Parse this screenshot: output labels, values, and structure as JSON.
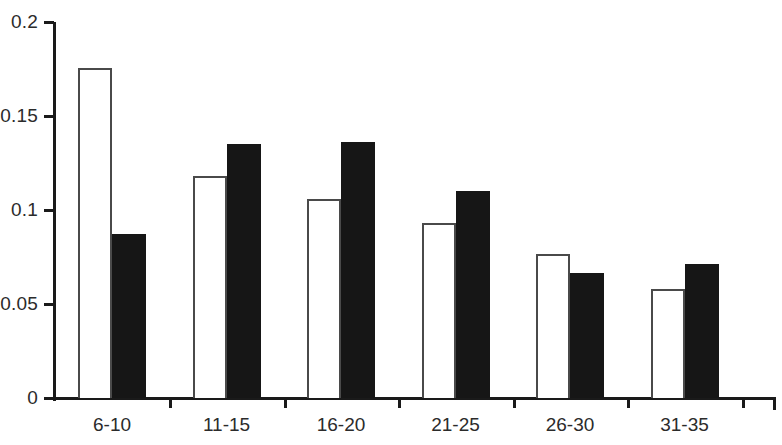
{
  "chart_data": {
    "type": "bar",
    "title": "",
    "subtitle": "",
    "xlabel": "",
    "ylabel": "",
    "categories": [
      "6-10",
      "11-15",
      "16-20",
      "21-25",
      "26-30",
      "31-35"
    ],
    "series": [
      {
        "name": "open",
        "style": "white-outlined",
        "values": [
          0.1755,
          0.118,
          0.106,
          0.093,
          0.0766,
          0.058
        ]
      },
      {
        "name": "filled",
        "style": "black-filled",
        "values": [
          0.087,
          0.135,
          0.136,
          0.11,
          0.0665,
          0.0713
        ]
      }
    ],
    "ylim": [
      0,
      0.2
    ],
    "yticks": [
      0,
      0.05,
      0.1,
      0.15,
      0.2
    ],
    "ytick_labels": [
      "0",
      "0.05",
      "0.1",
      "0.15",
      "0.2"
    ],
    "grid": false,
    "legend": "none",
    "axis_color": "#1a1a1a",
    "open_bar_color": "#ffffff",
    "open_bar_border_color": "#4a4a4a",
    "filled_bar_color": "#161616"
  }
}
